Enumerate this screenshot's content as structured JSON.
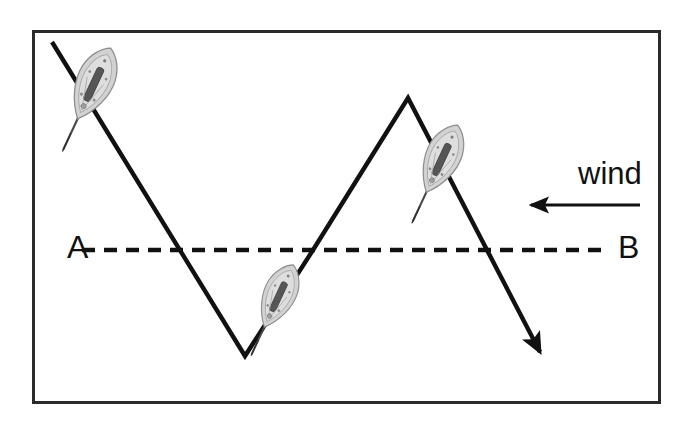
{
  "figure": {
    "background_color": "#ffffff",
    "border_color": "#2b2b2b",
    "line_color": "#111111",
    "boat_hull_color": "#cfcfcf",
    "boat_detail_color": "#5a5a5a",
    "boat_mast_color": "#3a3a3a"
  },
  "labels": {
    "start_point": "A",
    "end_point": "B",
    "wind": "wind"
  },
  "chart_data": {
    "type": "line",
    "xlabel": "",
    "ylabel": "",
    "xlim": [
      0,
      680
    ],
    "ylim": [
      425,
      0
    ],
    "grid": false,
    "legend": "none",
    "series": [
      {
        "name": "tacking-course",
        "style": "solid",
        "arrow_end": true,
        "points": [
          {
            "x": 52,
            "y": 42
          },
          {
            "x": 245,
            "y": 356
          },
          {
            "x": 313,
            "y": 250
          },
          {
            "x": 408,
            "y": 98
          },
          {
            "x": 540,
            "y": 352
          }
        ]
      },
      {
        "name": "direct-course-AB",
        "style": "dashed",
        "arrow_end": false,
        "points": [
          {
            "x": 82,
            "y": 250
          },
          {
            "x": 603,
            "y": 250
          }
        ]
      },
      {
        "name": "wind-direction",
        "style": "solid",
        "arrow_end": true,
        "points": [
          {
            "x": 640,
            "y": 205
          },
          {
            "x": 525,
            "y": 205
          }
        ]
      }
    ],
    "annotations": [
      {
        "name": "label-A",
        "text": "A",
        "x": 67,
        "y": 258
      },
      {
        "name": "label-B",
        "text": "B",
        "x": 618,
        "y": 258
      },
      {
        "name": "label-wind",
        "text": "wind",
        "x": 578,
        "y": 184
      }
    ],
    "markers": [
      {
        "name": "boat-1",
        "x": 92,
        "y": 88,
        "rotation": 205,
        "scale": 1.0
      },
      {
        "name": "boat-2",
        "x": 277,
        "y": 300,
        "rotation": 205,
        "scale": 0.88
      },
      {
        "name": "boat-3",
        "x": 440,
        "y": 163,
        "rotation": 205,
        "scale": 0.95
      }
    ],
    "frame": {
      "x": 32,
      "y": 30,
      "width": 629,
      "height": 374
    }
  }
}
